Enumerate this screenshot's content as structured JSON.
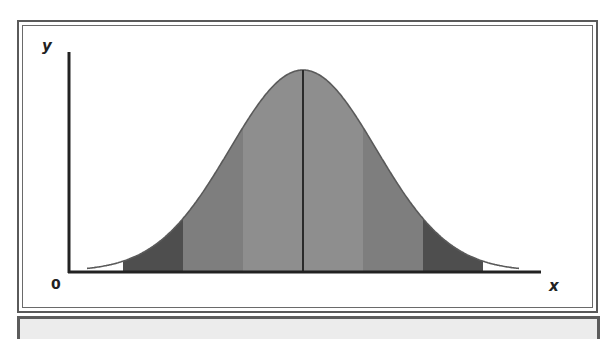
{
  "chart_data": {
    "type": "area",
    "title": "",
    "xlabel": "x",
    "ylabel": "y",
    "origin_label": "0",
    "mean": 0,
    "std": 1,
    "x_range": [
      -3.2,
      3.2
    ],
    "bands": [
      {
        "from": -3,
        "to": -2,
        "shade": "dark",
        "color": "#4e4e4e"
      },
      {
        "from": -2,
        "to": -1,
        "shade": "medium",
        "color": "#7e7e7e"
      },
      {
        "from": -1,
        "to": 0,
        "shade": "light",
        "color": "#8e8e8e"
      },
      {
        "from": 0,
        "to": 1,
        "shade": "light",
        "color": "#8e8e8e"
      },
      {
        "from": 1,
        "to": 2,
        "shade": "medium",
        "color": "#7e7e7e"
      },
      {
        "from": 2,
        "to": 3,
        "shade": "dark",
        "color": "#4e4e4e"
      }
    ],
    "mean_line": 0,
    "grid": false,
    "legend": null
  },
  "axis_labels": {
    "x": "x",
    "y": "y",
    "origin": "0"
  },
  "colors": {
    "curve": "#5a5a5a",
    "axis": "#222222",
    "mean_line": "#2a2a2a"
  }
}
